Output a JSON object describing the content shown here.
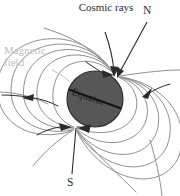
{
  "figure": {
    "background_color": "#ffffff"
  },
  "labels": {
    "cosmic_rays": "Cosmic rays",
    "north_pole": "N",
    "south_pole": "S",
    "magnetic_field": "Magnetic field",
    "equator": "Equator"
  },
  "colors": {
    "planet_fill": "#575757",
    "planet_outline": "#2f2f2f",
    "field_line": "#8f8f8f",
    "arrow_dark": "#2b2b2b",
    "text_dark": "#2b2b2b",
    "text_light": "#c0c0c0",
    "equator_line": "#141414"
  },
  "geometry": {
    "planet_center_x": 95,
    "planet_center_y": 99,
    "planet_radius": 28,
    "north_pole_x": 116,
    "north_pole_y": 76,
    "south_pole_x": 75,
    "south_pole_y": 126
  },
  "elements": {
    "planet_name": "planet-sphere",
    "field_loop_count": 10,
    "cosmic_ray_arrow_count": 2,
    "field_arrowhead_count": 5
  }
}
